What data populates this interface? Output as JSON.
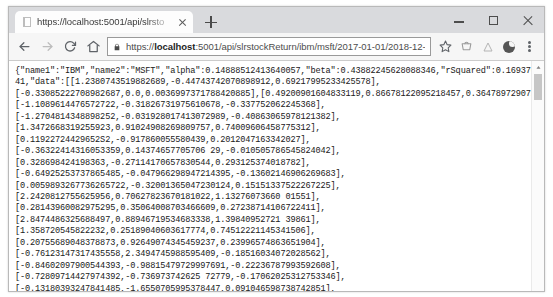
{
  "window": {
    "controls": {
      "minimize": "minimize-button",
      "maximize": "maximize-button",
      "close": "close-button"
    }
  },
  "tab": {
    "title": "https://localhost:5001/api/slrsto",
    "close_label": "Close tab",
    "new_tab_label": "New tab"
  },
  "toolbar": {
    "back_label": "Back",
    "forward_label": "Forward",
    "reload_label": "Reload",
    "home_label": "Home",
    "bookmark_label": "Bookmark this page",
    "url_prefix": "https://",
    "url_host_bold": "localhost",
    "url_suffix": ":5001/api/slrstockReturn/ibm/msft/2017-01-01/2018-12-31",
    "url_full": "https://localhost:5001/api/slrstockReturn/ibm/msft/2017-01-01/2018-12-31"
  },
  "response": {
    "name1": "IBM",
    "name2": "MSFT",
    "alpha": 0.14888512413640057,
    "beta": 0.43882245628088346,
    "rSquared": 0.1693769104770304,
    "lines": [
      "{\"name1\":\"IBM\",\"name2\":\"MSFT\",\"alpha\":0.14888512413640057,\"beta\":0.43882245628088346,\"rSquared\":0.169376910477030",
      "41,\"data\":[[1.2380743519882689,-0.44743742070898912,0.69217995233425578],",
      "[-0.33085222708982687,0.0,0.0036997371788420885],[0.49200901604833119,0.86678122095218457,0.36478972907106988],",
      "[-1.1089614476572722,-0.31826731975610678,-0.337752062245368],",
      "[-1.2704814348898252,-0.031928017413072989,-0.40863065978121382],",
      "[1.3472668319255923,0.91024908269809757,0.74009606458775312],",
      "[0.11922724429652S2,-0.917860055580439,0.2012047163342027],",
      "[-0.36322414316053359,0.14374657705706 29,-0.010505786545824042],",
      "[0.328698424198363,-0.27114170657830544,0.293125374018782],",
      "[-0.64925253737865485,-0.047966298947214395,-0.13602146906269683],",
      "[0.0059893267736265722,-0.32001365047230124,0.15151337522267225],",
      "[2.2420812755625956,0.70627823670181022,1.13276073660 01551],",
      "[0.28143960082975295,0.35064008703466609,0.27238714106722411],",
      "[2.8474486325688497,0.88946719534683338,1.39840952721 39861],",
      "[1.358720545822232,0.25189040603617774,0.74512221145341506],",
      "[0.20755689048378873,0.92649074345459237,0.23996574863651904],",
      "[-0.76123147317435558,2.3494745988595409,-0.18516034072028562],",
      "[-0.84602097900544393,-0.98815479729997691,-0.22236787993592608],",
      "[-0.72809714427974392,-0.736973742625 72779,-0.17062025312753346],",
      "[-0.13180393247841485,-1.6550705995378447,0.091046598738742851],",
      "[0.16638883176780628,-0.64486060299586156,0.221900279990456],",
      "[0.71027636578472741,0.8073582709868975,0.46057034360831395],"
    ]
  },
  "scrollbar": {
    "up_arrow": "scroll-up-arrow"
  },
  "colors": {
    "tabstrip": "#d9dadd",
    "toolbar": "#f6f6f6",
    "text": "#202020",
    "omnibox_border": "#9a9a9a"
  }
}
